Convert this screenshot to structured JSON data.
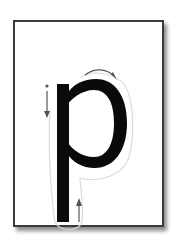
{
  "card": {
    "letter": "p",
    "letter_color": "#0a0a0a",
    "arrow_color": "#555555",
    "trace_color": "#d8d8d8",
    "border_color": "#3a3a3a",
    "arrows": [
      {
        "name": "down-stroke",
        "direction": "down"
      },
      {
        "name": "bowl-stroke",
        "direction": "clockwise"
      },
      {
        "name": "up-stroke",
        "direction": "up"
      }
    ]
  }
}
